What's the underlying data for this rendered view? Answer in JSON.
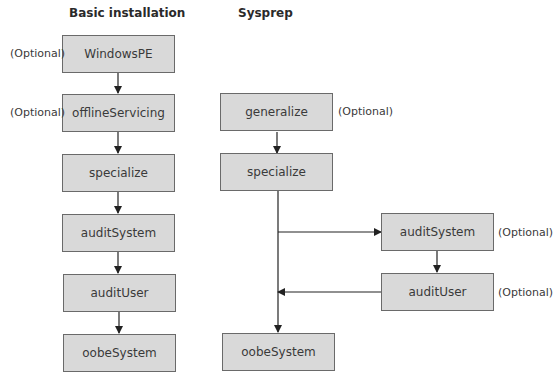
{
  "headings": {
    "basic": "Basic installation",
    "sysprep": "Sysprep"
  },
  "optional_label": "(Optional)",
  "basic_installation": {
    "steps": [
      {
        "label": "WindowsPE",
        "optional": true
      },
      {
        "label": "offlineServicing",
        "optional": true
      },
      {
        "label": "specialize",
        "optional": false
      },
      {
        "label": "auditSystem",
        "optional": false
      },
      {
        "label": "auditUser",
        "optional": false
      },
      {
        "label": "oobeSystem",
        "optional": false
      }
    ]
  },
  "sysprep": {
    "steps": [
      {
        "label": "generalize",
        "optional": true
      },
      {
        "label": "specialize",
        "optional": false
      },
      {
        "label": "oobeSystem",
        "optional": false
      }
    ],
    "branch": [
      {
        "label": "auditSystem",
        "optional": true
      },
      {
        "label": "auditUser",
        "optional": true
      }
    ]
  },
  "colors": {
    "box_fill": "#d9d9d9",
    "box_border": "#6a6a6a",
    "line": "#222222"
  }
}
